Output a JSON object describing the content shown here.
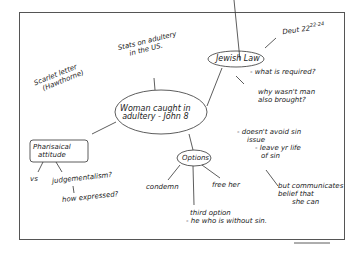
{
  "mindmap": {
    "central": {
      "line1": "Woman caught in",
      "line2": "adultery - John 8"
    },
    "stats": {
      "line1": "Stats on adultery",
      "line2": "in the US."
    },
    "scarlet": {
      "line1": "Scarlet letter",
      "line2": "(Hawthorne)"
    },
    "jewish_law": {
      "label": "Jewish Law",
      "ref": "Deut 22",
      "ref_sup": "22-24",
      "q1": "- what is required?",
      "q2a": "why wasn't man",
      "q2b": "also brought?"
    },
    "pharisaical": {
      "line1": "Pharisaical",
      "line2": "attitude",
      "vs": "vs",
      "judg": "judgementalism?",
      "how": "how expressed?"
    },
    "options": {
      "label": "Options",
      "condemn": "condemn",
      "free": "free her",
      "third1": "third option",
      "third2": "- he who is without sin."
    },
    "sin": {
      "l1": "- doesn't avoid sin",
      "l2": "issue",
      "l3": "- leave yr life",
      "l4": "of sin",
      "b1": "but communicates",
      "b2": "belief that",
      "b3": "she can"
    }
  }
}
